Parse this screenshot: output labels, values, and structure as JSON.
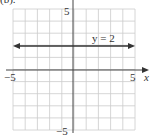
{
  "header": {
    "partial_label": "(b)."
  },
  "chart_data": {
    "type": "line",
    "title": "",
    "xlabel": "x",
    "ylabel": "y",
    "xlim": [
      -5,
      5
    ],
    "ylim": [
      -5,
      5
    ],
    "grid": true,
    "grid_step": 1,
    "tick_labels": {
      "x_min": "−5",
      "x_max": "5",
      "y_max": "5",
      "y_min": "−5"
    },
    "series": [
      {
        "name": "y = 2",
        "x": [
          -5,
          5
        ],
        "y": [
          2,
          2
        ],
        "arrows_both_ends": true
      }
    ],
    "annotations": [
      {
        "text": "y = 2",
        "x": 2.5,
        "y": 2.3
      }
    ],
    "colors": {
      "line": "#333333",
      "grid": "#cccccc",
      "axis": "#444444"
    }
  }
}
